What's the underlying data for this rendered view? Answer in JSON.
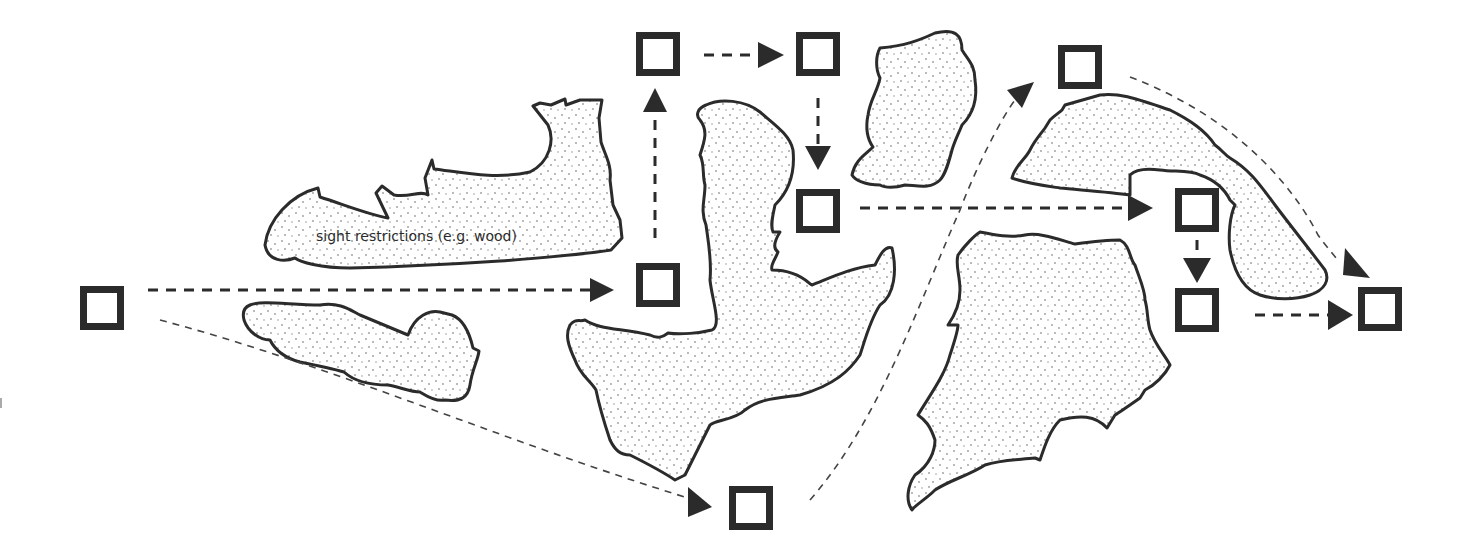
{
  "diagram": {
    "type": "movement-path-with-sight-restrictions",
    "colors": {
      "stroke": "#2b2b2b",
      "fill": "#ffffff",
      "stipple": "#9a9a9a",
      "path_thin": "#444444"
    },
    "obstacle_label": "sight restrictions (e.g. wood)",
    "nodes": [
      {
        "id": "n1",
        "x": 80,
        "y": 286
      },
      {
        "id": "n2",
        "x": 636,
        "y": 263
      },
      {
        "id": "n3",
        "x": 636,
        "y": 32
      },
      {
        "id": "n4",
        "x": 796,
        "y": 32
      },
      {
        "id": "n5",
        "x": 796,
        "y": 189
      },
      {
        "id": "n6",
        "x": 729,
        "y": 486
      },
      {
        "id": "n7",
        "x": 1058,
        "y": 45
      },
      {
        "id": "n8",
        "x": 1175,
        "y": 188
      },
      {
        "id": "n9",
        "x": 1175,
        "y": 288
      },
      {
        "id": "n10",
        "x": 1358,
        "y": 287
      }
    ],
    "edges": [
      {
        "from": "n1",
        "to": "n2",
        "style": "bold-dashed"
      },
      {
        "from": "n2",
        "to": "n3",
        "style": "bold-dashed"
      },
      {
        "from": "n3",
        "to": "n4",
        "style": "bold-dashed"
      },
      {
        "from": "n4",
        "to": "n5",
        "style": "bold-dashed"
      },
      {
        "from": "n5",
        "to": "n8",
        "style": "bold-dashed"
      },
      {
        "from": "n8",
        "to": "n9",
        "style": "bold-dashed"
      },
      {
        "from": "n9",
        "to": "n10",
        "style": "bold-dashed"
      },
      {
        "from": "n1",
        "to": "n6",
        "style": "thin-dashed"
      },
      {
        "from": "n6",
        "to": "n7",
        "style": "thin-dashed"
      },
      {
        "from": "n7",
        "to": "n10",
        "style": "thin-dashed"
      }
    ]
  }
}
